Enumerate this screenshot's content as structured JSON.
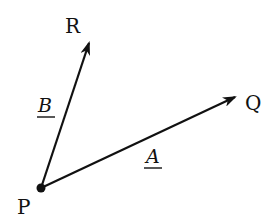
{
  "diagram": {
    "type": "vector-diagram",
    "colors": {
      "ink": "#111111",
      "background": "#ffffff"
    },
    "points": {
      "P": {
        "label": "P",
        "x": 41,
        "y": 188
      },
      "Q": {
        "label": "Q",
        "x": 235,
        "y": 97
      },
      "R": {
        "label": "R",
        "x": 89,
        "y": 43
      }
    },
    "vectors": [
      {
        "name": "A",
        "label": "A",
        "from": "P",
        "to": "Q",
        "underlined": true
      },
      {
        "name": "B",
        "label": "B",
        "from": "P",
        "to": "R",
        "underlined": true
      }
    ]
  }
}
